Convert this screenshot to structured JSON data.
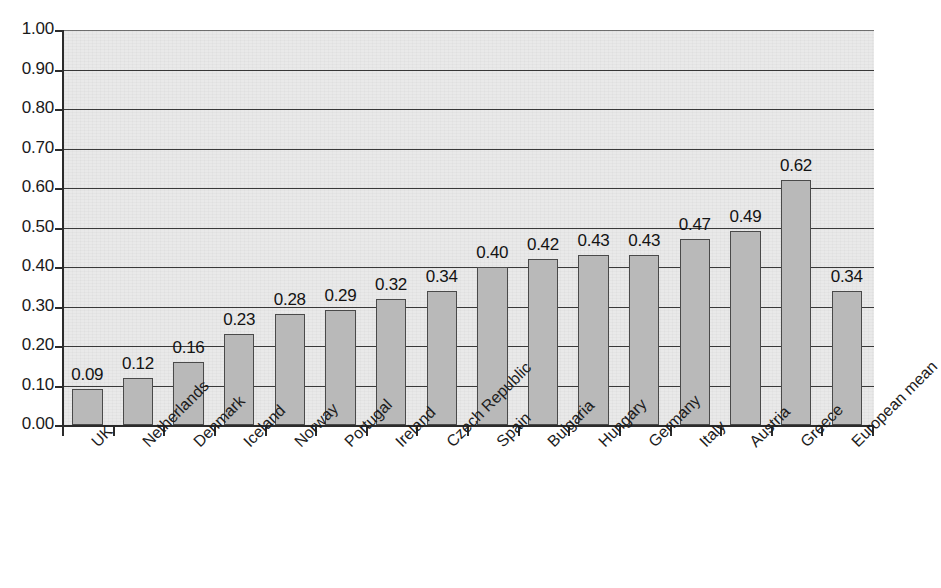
{
  "chart_data": {
    "type": "bar",
    "title": "",
    "subtitle": "",
    "xlabel": "",
    "ylabel": "",
    "ylim": [
      0.0,
      1.0
    ],
    "ytick_step": 0.1,
    "grid": true,
    "legend": "none",
    "orientation": "vertical",
    "bar_label_format": "0.00",
    "categories": [
      "UK",
      "Netherlands",
      "Denmark",
      "Iceland",
      "Norway",
      "Portugal",
      "Ireland",
      "Czech Republic",
      "Spain",
      "Bulgaria",
      "Hungary",
      "Germany",
      "Italy",
      "Austria",
      "Greece",
      "European mean"
    ],
    "values": [
      0.09,
      0.12,
      0.16,
      0.23,
      0.28,
      0.29,
      0.32,
      0.34,
      0.4,
      0.42,
      0.43,
      0.43,
      0.47,
      0.49,
      0.62,
      0.34
    ],
    "value_labels": [
      "0.09",
      "0.12",
      "0.16",
      "0.23",
      "0.28",
      "0.29",
      "0.32",
      "0.34",
      "0.40",
      "0.42",
      "0.43",
      "0.43",
      "0.47",
      "0.49",
      "0.62",
      "0.34"
    ],
    "ytick_labels": [
      "1.00",
      "0.90",
      "0.80",
      "0.70",
      "0.60",
      "0.50",
      "0.40",
      "0.30",
      "0.20",
      "0.10",
      "0.00"
    ],
    "ytick_values": [
      1.0,
      0.9,
      0.8,
      0.7,
      0.6,
      0.5,
      0.4,
      0.3,
      0.2,
      0.1,
      0.0
    ],
    "colors": {
      "bar_fill": "#b9b9b9",
      "bar_edge": "#4a4a4a",
      "plot_background": "#e9e9e9",
      "gridline": "#3a3a3a",
      "axis": "#2b2b2b",
      "text": "#1a1a1a",
      "page_background": "#ffffff"
    }
  },
  "page": {
    "top_bleed_text": "· · · · · ·"
  }
}
